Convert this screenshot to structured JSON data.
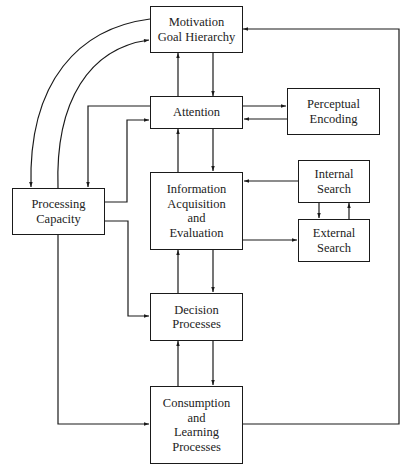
{
  "diagram": {
    "nodes": {
      "motivation": {
        "lines": [
          "Motivation",
          "Goal Hierarchy"
        ]
      },
      "attention": {
        "lines": [
          "Attention"
        ]
      },
      "perceptual": {
        "lines": [
          "Perceptual",
          "Encoding"
        ]
      },
      "processing": {
        "lines": [
          "Processing",
          "Capacity"
        ]
      },
      "information": {
        "lines": [
          "Information",
          "Acquisition",
          "and",
          "Evaluation"
        ]
      },
      "internal": {
        "lines": [
          "Internal",
          "Search"
        ]
      },
      "external": {
        "lines": [
          "External",
          "Search"
        ]
      },
      "decision": {
        "lines": [
          "Decision",
          "Processes"
        ]
      },
      "consumption": {
        "lines": [
          "Consumption",
          "and",
          "Learning",
          "Processes"
        ]
      }
    },
    "edges": [
      {
        "from": "motivation",
        "to": "attention"
      },
      {
        "from": "attention",
        "to": "motivation"
      },
      {
        "from": "attention",
        "to": "perceptual"
      },
      {
        "from": "perceptual",
        "to": "attention"
      },
      {
        "from": "attention",
        "to": "information"
      },
      {
        "from": "information",
        "to": "attention"
      },
      {
        "from": "internal",
        "to": "information"
      },
      {
        "from": "information",
        "to": "external"
      },
      {
        "from": "internal",
        "to": "external"
      },
      {
        "from": "external",
        "to": "internal"
      },
      {
        "from": "information",
        "to": "decision"
      },
      {
        "from": "decision",
        "to": "information"
      },
      {
        "from": "decision",
        "to": "consumption"
      },
      {
        "from": "consumption",
        "to": "decision"
      },
      {
        "from": "consumption",
        "to": "motivation"
      },
      {
        "from": "motivation",
        "to": "processing"
      },
      {
        "from": "processing",
        "to": "motivation"
      },
      {
        "from": "attention",
        "to": "processing"
      },
      {
        "from": "processing",
        "to": "attention"
      },
      {
        "from": "processing",
        "to": "decision"
      },
      {
        "from": "processing",
        "to": "consumption"
      }
    ]
  }
}
